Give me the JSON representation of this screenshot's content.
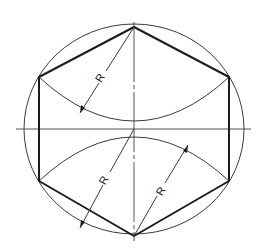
{
  "diagram": {
    "type": "geometric-construction",
    "circle": {
      "cx": 134,
      "cy": 129,
      "rx": 110,
      "ry": 105,
      "color": "#3a3a3a"
    },
    "hexagon": {
      "vertices": [
        [
          134,
          27
        ],
        [
          229,
          77
        ],
        [
          229,
          181
        ],
        [
          134,
          236
        ],
        [
          39,
          181
        ],
        [
          39,
          77
        ]
      ],
      "color": "#1c1c1c"
    },
    "centerlines": {
      "horizontal": {
        "x1": 16,
        "x2": 251,
        "y": 129
      },
      "vertical": {
        "x": 134,
        "y1": 22,
        "y2": 241
      }
    },
    "arcs": [
      {
        "name": "upper-arc",
        "center": "top-vertex",
        "from": [
          39,
          77
        ],
        "to": [
          229,
          77
        ],
        "through": [
          134,
          129
        ]
      },
      {
        "name": "lower-arc",
        "center": "bottom-vertex",
        "from": [
          39,
          181
        ],
        "to": [
          229,
          181
        ],
        "through": [
          134,
          129
        ]
      }
    ],
    "dimensions": [
      {
        "label": "R",
        "from": [
          134,
          27
        ],
        "to": [
          80,
          113
        ]
      },
      {
        "label": "R",
        "from": [
          134,
          129
        ],
        "to": [
          80,
          228
        ]
      },
      {
        "label": "R",
        "from": [
          134,
          236
        ],
        "to": [
          188,
          145
        ]
      }
    ]
  }
}
